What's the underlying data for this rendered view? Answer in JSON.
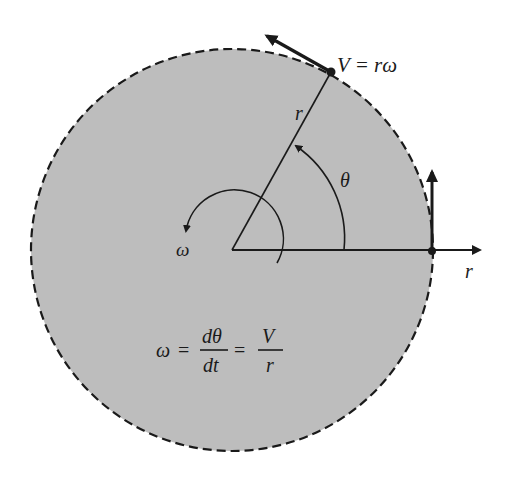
{
  "diagram": {
    "type": "circular-motion",
    "colors": {
      "disk_fill": "#bdbdbd",
      "stroke": "#1a1a1a",
      "background": "#ffffff"
    },
    "labels": {
      "velocity": "V = rω",
      "radius_on_line": "r",
      "angle": "θ",
      "angular_velocity": "ω",
      "radial_axis": "r"
    },
    "equation": {
      "lhs": "ω",
      "eq1": "=",
      "frac1_num": "dθ",
      "frac1_den": "dt",
      "eq2": "=",
      "frac2_num": "V",
      "frac2_den": "r"
    }
  }
}
